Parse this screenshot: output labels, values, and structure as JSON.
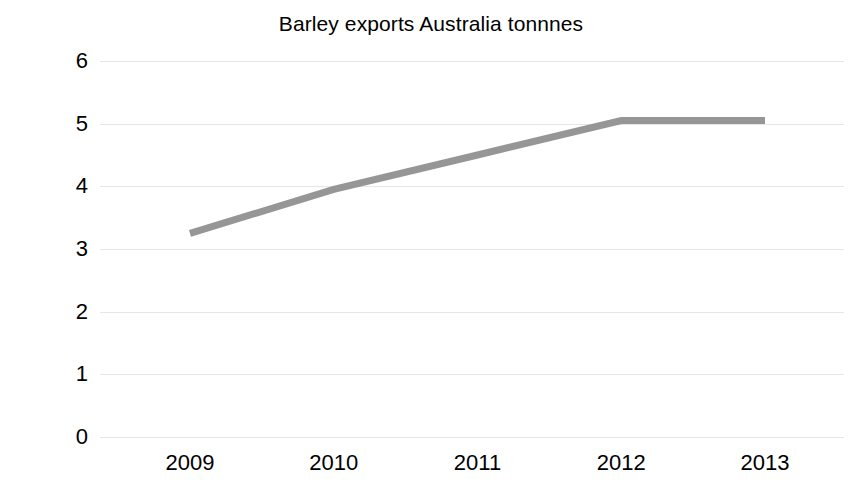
{
  "chart_data": {
    "type": "line",
    "title": "Barley exports Australia tonnnes",
    "xlabel": "",
    "ylabel": "Millions",
    "categories": [
      "2009",
      "2010",
      "2011",
      "2012",
      "2013"
    ],
    "x": [
      2009,
      2010,
      2011,
      2012,
      2013
    ],
    "series": [
      {
        "name": "Barley exports",
        "values": [
          3.25,
          3.95,
          4.5,
          5.05,
          5.05
        ],
        "color": "#969696",
        "line_width": 7,
        "markers": false
      }
    ],
    "ylim": [
      0,
      6
    ],
    "yticks": [
      0,
      1,
      2,
      3,
      4,
      5,
      6
    ],
    "ytick_labels": [
      "0",
      "1",
      "2",
      "3",
      "4",
      "5",
      "6"
    ],
    "grid": true,
    "grid_axis": "y",
    "grid_color": "#e6e6e6",
    "legend": false,
    "legend_position": "none",
    "units": "Millions of tonnes",
    "background": "#ffffff",
    "text_color": "#000000"
  }
}
